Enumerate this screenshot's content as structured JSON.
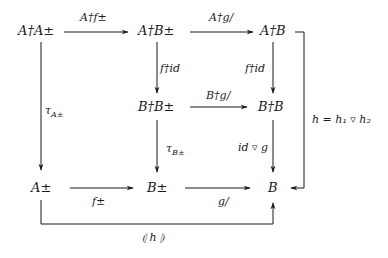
{
  "diagram": {
    "type": "commutative-diagram",
    "nodes": {
      "r1c1": "A†A±",
      "r1c2": "A†B±",
      "r1c3": "A†B",
      "r2c2": "B†B±",
      "r2c3": "B†B",
      "r3c1": "A±",
      "r3c2": "B±",
      "r3c3": "B"
    },
    "arrows": {
      "r1c1_r1c2": "A†f±",
      "r1c2_r1c3": "A†g/",
      "r1c2_r2c2": "f†id",
      "r1c3_r2c3": "f†id",
      "r2c2_r2c3": "B†g/",
      "r1c1_r3c1": "τA±",
      "r2c2_r3c2": "τB±",
      "r2c3_r3c3": "id ▿ g",
      "r3c1_r3c2": "f±",
      "r3c2_r3c3": "g/",
      "bottom_loop": "⦇ h ⦈",
      "right_loop": "h = h₁ ▿ h₂"
    },
    "tau_symbol": "τ",
    "tau_sub_A": "A±",
    "tau_sub_B": "B±",
    "line_color": "#1a1a1a"
  }
}
